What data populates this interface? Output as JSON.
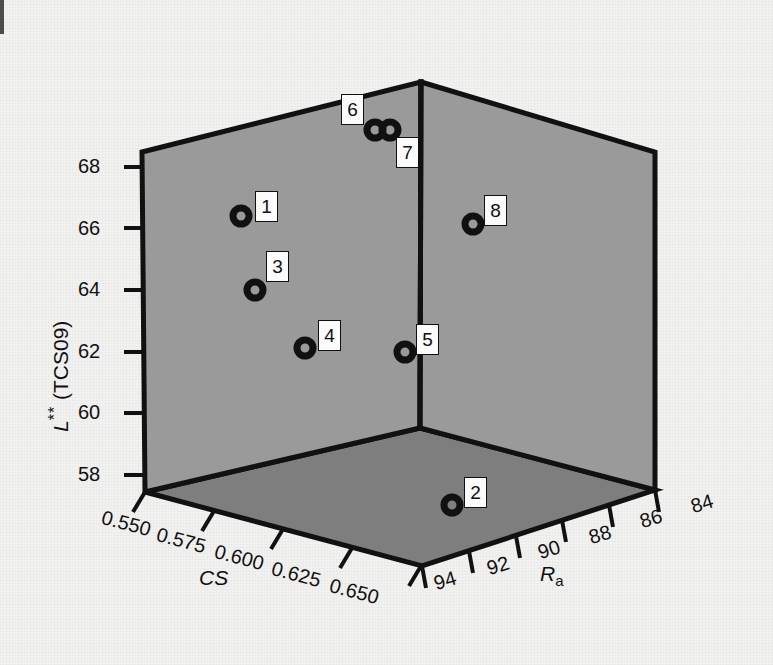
{
  "figure": {
    "background_color": "#f2f2f0",
    "wall_color": "#9a9a9a",
    "floor_color": "#7e7e7e",
    "line_color": "#111111",
    "marker_color": "#111111"
  },
  "chart_data": {
    "type": "scatter",
    "projection": "3d",
    "title": "",
    "xlabel": "CS",
    "ylabel": "Ra",
    "zlabel": "L** (TCS09)",
    "grid": false,
    "legend": "none",
    "axes": {
      "cs": {
        "label": "CS",
        "ticks": [
          "0.550",
          "0.575",
          "0.600",
          "0.625",
          "0.650"
        ],
        "values": [
          0.55,
          0.575,
          0.6,
          0.625,
          0.65
        ],
        "range": [
          0.55,
          0.65
        ]
      },
      "ra": {
        "label": "Ra",
        "label_base": "R",
        "label_sub": "a",
        "ticks": [
          "94",
          "92",
          "90",
          "88",
          "86",
          "84"
        ],
        "values": [
          94,
          92,
          90,
          88,
          86,
          84
        ],
        "range": [
          94,
          84
        ],
        "reversed": true
      },
      "l": {
        "label": "L** (TCS09)",
        "label_base": "L",
        "label_sup": "**",
        "label_paren": " (TCS09)",
        "ticks": [
          "58",
          "60",
          "62",
          "64",
          "66",
          "68"
        ],
        "values": [
          58,
          60,
          62,
          64,
          66,
          68
        ],
        "range": [
          57,
          69
        ]
      }
    },
    "points": [
      {
        "id": "1",
        "label": "1",
        "cs": 0.583,
        "ra": 92.0,
        "l": 66.3,
        "px": 241,
        "py": 216,
        "lx": 255,
        "ly": 191
      },
      {
        "id": "2",
        "label": "2",
        "cs": 0.65,
        "ra": 91.4,
        "l": 57.0,
        "px": 452,
        "py": 505,
        "lx": 464,
        "ly": 477
      },
      {
        "id": "3",
        "label": "3",
        "cs": 0.6,
        "ra": 92.0,
        "l": 64.0,
        "px": 255,
        "py": 290,
        "lx": 266,
        "ly": 251
      },
      {
        "id": "4",
        "label": "4",
        "cs": 0.621,
        "ra": 92.0,
        "l": 62.2,
        "px": 305,
        "py": 348,
        "lx": 318,
        "ly": 320
      },
      {
        "id": "5",
        "label": "5",
        "cs": 0.65,
        "ra": 92.0,
        "l": 62.0,
        "px": 405,
        "py": 352,
        "lx": 416,
        "ly": 324
      },
      {
        "id": "6",
        "label": "6",
        "cs": 0.645,
        "ra": 93.2,
        "l": 68.9,
        "px": 375,
        "py": 130,
        "lx": 341,
        "ly": 94
      },
      {
        "id": "7",
        "label": "7",
        "cs": 0.65,
        "ra": 92.8,
        "l": 68.9,
        "px": 390,
        "py": 130,
        "lx": 396,
        "ly": 137
      },
      {
        "id": "8",
        "label": "8",
        "cs": 0.65,
        "ra": 88.2,
        "l": 66.1,
        "px": 473,
        "py": 224,
        "lx": 484,
        "ly": 195
      }
    ]
  },
  "geometry": {
    "top_left": [
      142,
      152
    ],
    "top_back": [
      421,
      82
    ],
    "top_right": [
      655,
      152
    ],
    "bottom_left": [
      145,
      492
    ],
    "bottom_back": [
      420,
      428
    ],
    "bottom_right": [
      655,
      490
    ],
    "floor_front": [
      422,
      566
    ]
  },
  "z_ticks": [
    {
      "text": "68",
      "x": 78,
      "y": 155
    },
    {
      "text": "66",
      "x": 78,
      "y": 217
    },
    {
      "text": "64",
      "x": 78,
      "y": 278
    },
    {
      "text": "62",
      "x": 78,
      "y": 340
    },
    {
      "text": "60",
      "x": 78,
      "y": 401
    },
    {
      "text": "58",
      "x": 78,
      "y": 463
    }
  ],
  "cs_ticks": [
    {
      "text": "0.550",
      "x": 105,
      "y": 506
    },
    {
      "text": "0.575",
      "x": 160,
      "y": 523
    },
    {
      "text": "0.600",
      "x": 218,
      "y": 540
    },
    {
      "text": "0.625",
      "x": 275,
      "y": 557
    },
    {
      "text": "0.650",
      "x": 333,
      "y": 574
    }
  ],
  "ra_ticks": [
    {
      "text": "94",
      "x": 431,
      "y": 573
    },
    {
      "text": "92",
      "x": 484,
      "y": 558
    },
    {
      "text": "90",
      "x": 535,
      "y": 542
    },
    {
      "text": "88",
      "x": 586,
      "y": 527
    },
    {
      "text": "86",
      "x": 637,
      "y": 511
    },
    {
      "text": "84",
      "x": 688,
      "y": 496
    }
  ],
  "axis_titles": {
    "cs": {
      "text": "CS",
      "x": 199,
      "y": 583
    },
    "ra": {
      "text": "Ra",
      "x": 540,
      "y": 578
    },
    "l": {
      "text": "L** (TCS09)",
      "x": 38,
      "y": 420
    }
  }
}
